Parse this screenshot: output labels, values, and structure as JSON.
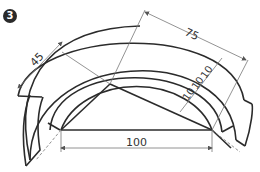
{
  "figure": {
    "label": "3",
    "dimensions": {
      "base": "100",
      "left_diag": "45",
      "top_right": "75",
      "spacing_1": "10",
      "spacing_2": "10",
      "spacing_3": "10"
    },
    "colors": {
      "line": "#2b2b2b",
      "dim_line": "#777777",
      "background": "#ffffff"
    }
  }
}
